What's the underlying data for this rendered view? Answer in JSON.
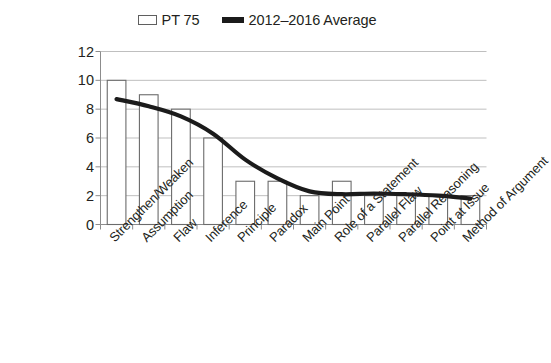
{
  "chart_data": {
    "type": "bar",
    "title": "",
    "subtitle": "",
    "xlabel": "",
    "ylabel": "",
    "ylim": [
      0,
      12
    ],
    "ytick_step": 2,
    "yticks": [
      12,
      10,
      8,
      6,
      4,
      2,
      0
    ],
    "grid": true,
    "legend_position": "top-center",
    "categories": [
      "Strengthen/Weaken",
      "Assumption",
      "Flaw",
      "Inference",
      "Principle",
      "Paradox",
      "Main Point",
      "Role of a Statement",
      "Parallel Flaw",
      "Parallel Reasoning",
      "Point at Issue",
      "Method of Argument"
    ],
    "series": [
      {
        "name": "PT 75",
        "type": "bar",
        "values": [
          10,
          9,
          8,
          6,
          3,
          3,
          2,
          3,
          2,
          2,
          2,
          2
        ],
        "color": "#ffffff",
        "edge_color": "#6b6b6b"
      },
      {
        "name": "2012–2016 Average",
        "type": "line",
        "values": [
          8.7,
          8.2,
          7.5,
          6.3,
          4.5,
          3.2,
          2.3,
          2.1,
          2.15,
          2.1,
          2.0,
          1.8
        ],
        "color": "#1b1b1b"
      }
    ]
  },
  "legend": {
    "entries": [
      {
        "label": "PT 75",
        "marker": "hollow-bar-swatch"
      },
      {
        "label": "2012–2016 Average",
        "marker": "thick-line-swatch"
      }
    ]
  },
  "axes": {
    "y_tick_labels": [
      "12",
      "10",
      "8",
      "6",
      "4",
      "2",
      "0"
    ],
    "x_tick_labels": [
      "Strengthen/Weaken",
      "Assumption",
      "Flaw",
      "Inference",
      "Principle",
      "Paradox",
      "Main Point",
      "Role of a Statement",
      "Parallel Flaw",
      "Parallel Reasoning",
      "Point at Issue",
      "Method of Argument"
    ]
  },
  "colors": {
    "text": "#231f20",
    "grid": "#bfbfbf",
    "axis": "#8c8c8c",
    "bar_edge": "#6b6b6b",
    "bar_fill": "#ffffff",
    "line": "#1b1b1b",
    "background": "#ffffff"
  }
}
